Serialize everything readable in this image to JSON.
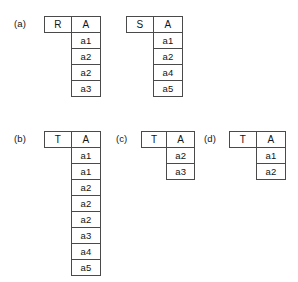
{
  "figure": {
    "type": "relational-table-diagram",
    "panels": [
      {
        "label": "(a)",
        "tables": [
          {
            "relation_name": "R",
            "attribute": "A",
            "rows": [
              "a1",
              "a2",
              "a2",
              "a3"
            ]
          },
          {
            "relation_name": "S",
            "attribute": "A",
            "rows": [
              "a1",
              "a2",
              "a4",
              "a5"
            ]
          }
        ]
      },
      {
        "label": "(b)",
        "tables": [
          {
            "relation_name": "T",
            "attribute": "A",
            "rows": [
              "a1",
              "a1",
              "a2",
              "a2",
              "a2",
              "a3",
              "a4",
              "a5"
            ]
          }
        ]
      },
      {
        "label": "(c)",
        "tables": [
          {
            "relation_name": "T",
            "attribute": "A",
            "rows": [
              "a2",
              "a3"
            ]
          }
        ]
      },
      {
        "label": "(d)",
        "tables": [
          {
            "relation_name": "T",
            "attribute": "A",
            "rows": [
              "a1",
              "a2"
            ]
          }
        ]
      }
    ]
  },
  "colors": {
    "background": "#ffffff",
    "border": "#4a4a4a",
    "text": "#141414"
  }
}
